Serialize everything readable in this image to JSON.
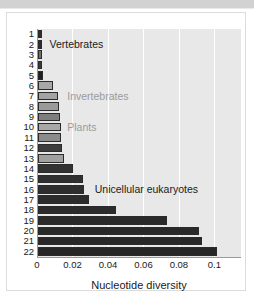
{
  "figure": {
    "background_color": "#ffffff",
    "plot_background_color": "#e8e8e8",
    "gridline_color": "#ffffff",
    "bar_dark_color": "#2d2d2d",
    "bar_gray_color": "#8f8f8f",
    "bar_light_color": "#b4b4b4",
    "annotation_gray_color": "#9b9b9b"
  },
  "chart_data": {
    "type": "bar",
    "orientation": "horizontal",
    "title": "",
    "xlabel": "Nucleotide diversity",
    "ylabel": "",
    "xlim": [
      0,
      0.115
    ],
    "xticks": [
      0,
      0.02,
      0.04,
      0.06,
      0.08,
      0.1
    ],
    "xtick_labels": [
      "0",
      "0.02",
      "0.04",
      "0.06",
      "0.08",
      "0.1"
    ],
    "grid": true,
    "grid_axis": "x",
    "legend": "none",
    "categories": [
      "1",
      "2",
      "3",
      "4",
      "5",
      "6",
      "7",
      "8",
      "9",
      "10",
      "11",
      "12",
      "13",
      "14",
      "15",
      "16",
      "17",
      "18",
      "19",
      "20",
      "21",
      "22"
    ],
    "values": [
      0.0022,
      0.0022,
      0.0024,
      0.0025,
      0.0031,
      0.0086,
      0.0114,
      0.0118,
      0.0125,
      0.013,
      0.0128,
      0.0136,
      0.0148,
      0.02,
      0.0252,
      0.0262,
      0.029,
      0.044,
      0.0725,
      0.0905,
      0.0925,
      0.101
    ],
    "bar_colors": [
      "#2d2d2d",
      "#2d2d2d",
      "#6f6f6f",
      "#3a3a3a",
      "#1f1f1f",
      "#a8a8a8",
      "#a3a3a3",
      "#9a9a9a",
      "#7e7e7e",
      "#a8a8a8",
      "#8b8b8b",
      "#3d3d3d",
      "#a0a0a0",
      "#323232",
      "#303030",
      "#2e2e2e",
      "#2c2c2c",
      "#2b2b2b",
      "#2a2a2a",
      "#292929",
      "#282828",
      "#262626"
    ],
    "annotations": [
      {
        "text": "Vertebrates",
        "x": 0.0065,
        "category": "2",
        "color": "dark"
      },
      {
        "text": "Invertebrates",
        "x": 0.0165,
        "category": "7",
        "color": "gray"
      },
      {
        "text": "Plants",
        "x": 0.0165,
        "category": "10",
        "color": "gray"
      },
      {
        "text": "Unicellular eukaryotes",
        "x": 0.032,
        "category": "16",
        "color": "dark"
      }
    ]
  }
}
